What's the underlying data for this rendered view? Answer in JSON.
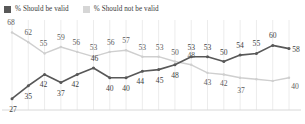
{
  "legend": {
    "entries": [
      {
        "label": "% Should be valid",
        "color": "#585858",
        "icon": "legend-swatch-dark"
      },
      {
        "label": "% Should not be valid",
        "color": "#d6d6d6",
        "icon": "legend-swatch-light"
      }
    ]
  },
  "chart_data": {
    "type": "line",
    "title": "",
    "subtitle": "",
    "xlabel": "",
    "ylabel": "",
    "ylim": [
      20,
      72
    ],
    "grid": "vertical",
    "legend_position": "top-left",
    "x": [
      1,
      2,
      3,
      4,
      5,
      6,
      7,
      8,
      9,
      10,
      11,
      12,
      13,
      14,
      15,
      16,
      17,
      18
    ],
    "categories": [
      "",
      "",
      "",
      "",
      "",
      "",
      "",
      "",
      "",
      "",
      "",
      "",
      "",
      "",
      "",
      "",
      "",
      ""
    ],
    "series": [
      {
        "name": "% Should be valid",
        "color": "#585858",
        "values": [
          27,
          35,
          42,
          37,
          42,
          46,
          40,
          40,
          44,
          45,
          48,
          53,
          53,
          50,
          54,
          55,
          60,
          58
        ],
        "labels": [
          "27",
          "35",
          "42",
          "37",
          "42",
          "46",
          "40",
          "40",
          "44",
          "45",
          "48",
          "53",
          "53",
          "50",
          "54",
          "55",
          "60",
          "58"
        ]
      },
      {
        "name": "% Should not be valid",
        "color": "#cfcfcf",
        "values": [
          68,
          62,
          55,
          59,
          56,
          53,
          56,
          57,
          53,
          53,
          50,
          48,
          43,
          42,
          40,
          39,
          38,
          40
        ],
        "labels": [
          "68",
          "62",
          "55",
          "59",
          "56",
          "53",
          "56",
          "57",
          "53",
          "53",
          "50",
          "48",
          "43",
          "42",
          "37",
          "",
          "",
          "40"
        ]
      }
    ],
    "visible_labels": {
      "upper_series": [
        "68",
        "62",
        "55",
        "59",
        "56",
        "53",
        "56",
        "57",
        "53",
        "53",
        "50",
        "48",
        "43",
        "42",
        "37",
        "40"
      ],
      "lower_series": [
        "27",
        "35",
        "42",
        "37",
        "42",
        "46",
        "40",
        "40",
        "44",
        "45",
        "54",
        "55",
        "60",
        "58"
      ]
    }
  },
  "axis": {
    "baseline_visible": true,
    "gridline_count": 18,
    "gridline_color": "#ececec",
    "baseline_color": "#d8d8d8"
  }
}
